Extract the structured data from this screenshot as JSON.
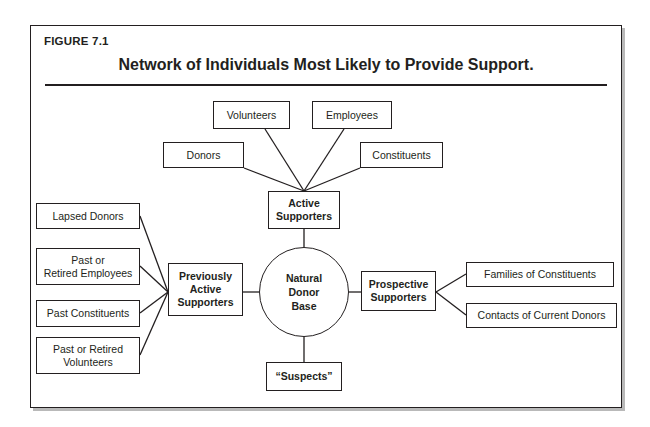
{
  "figure": {
    "label": "FIGURE 7.1",
    "title": "Network of Individuals Most Likely to Provide Support."
  },
  "colors": {
    "stroke": "#231f20",
    "background": "#ffffff",
    "frame_shadow": "#b9b9b9"
  },
  "diagram": {
    "type": "node-link-network",
    "center": {
      "id": "natural-donor-base",
      "label": "Natural\nDonor\nBase",
      "line1": "Natural",
      "line2": "Donor",
      "line3": "Base",
      "shape": "circle"
    },
    "hubs": [
      {
        "id": "active-supporters",
        "line1": "Active",
        "line2": "Supporters",
        "position": "top",
        "children": [
          {
            "id": "donors",
            "label": "Donors"
          },
          {
            "id": "volunteers",
            "label": "Volunteers"
          },
          {
            "id": "employees",
            "label": "Employees"
          },
          {
            "id": "constituents",
            "label": "Constituents"
          }
        ]
      },
      {
        "id": "previously-active-supporters",
        "line1": "Previously",
        "line2": "Active",
        "line3": "Supporters",
        "position": "left",
        "children": [
          {
            "id": "lapsed-donors",
            "label": "Lapsed Donors"
          },
          {
            "id": "past-or-retired-employees",
            "line1": "Past or",
            "line2": "Retired Employees"
          },
          {
            "id": "past-constituents",
            "label": "Past Constituents"
          },
          {
            "id": "past-or-retired-volunteers",
            "line1": "Past or Retired",
            "line2": "Volunteers"
          }
        ]
      },
      {
        "id": "prospective-supporters",
        "line1": "Prospective",
        "line2": "Supporters",
        "position": "right",
        "children": [
          {
            "id": "families-of-constituents",
            "label": "Families of Constituents"
          },
          {
            "id": "contacts-of-current-donors",
            "label": "Contacts of Current Donors"
          }
        ]
      },
      {
        "id": "suspects",
        "label": "“Suspects”",
        "position": "bottom",
        "children": []
      }
    ]
  }
}
